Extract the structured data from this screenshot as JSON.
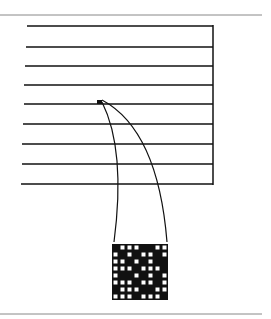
{
  "figure": {
    "colors": {
      "ink": "#111111",
      "rule": "#888888",
      "background": "#ffffff"
    },
    "scan_lines": [
      {
        "y": 26,
        "x1": 27
      },
      {
        "y": 47,
        "x1": 26
      },
      {
        "y": 66,
        "x1": 25
      },
      {
        "y": 85,
        "x1": 24
      },
      {
        "y": 104,
        "x1": 24
      },
      {
        "y": 124,
        "x1": 23
      },
      {
        "y": 144,
        "x1": 22
      },
      {
        "y": 164,
        "x1": 22
      },
      {
        "y": 184,
        "x1": 21
      }
    ],
    "right_edge_x": 213,
    "highlight_pixel": {
      "x": 97,
      "y": 100,
      "w": 5,
      "h": 4
    },
    "magnified_grid": {
      "x": 112,
      "y": 244,
      "size": 56,
      "rows": 8,
      "cols": 8,
      "cells": [
        [
          0,
          1,
          1,
          1,
          0,
          0,
          1,
          1
        ],
        [
          1,
          0,
          1,
          0,
          1,
          1,
          0,
          1
        ],
        [
          1,
          1,
          0,
          1,
          0,
          1,
          0,
          0
        ],
        [
          1,
          1,
          1,
          0,
          1,
          1,
          1,
          0
        ],
        [
          1,
          0,
          0,
          1,
          0,
          1,
          0,
          1
        ],
        [
          1,
          1,
          1,
          0,
          1,
          1,
          0,
          1
        ],
        [
          0,
          1,
          1,
          1,
          0,
          0,
          1,
          1
        ],
        [
          1,
          1,
          1,
          0,
          1,
          1,
          1,
          0
        ]
      ]
    }
  }
}
